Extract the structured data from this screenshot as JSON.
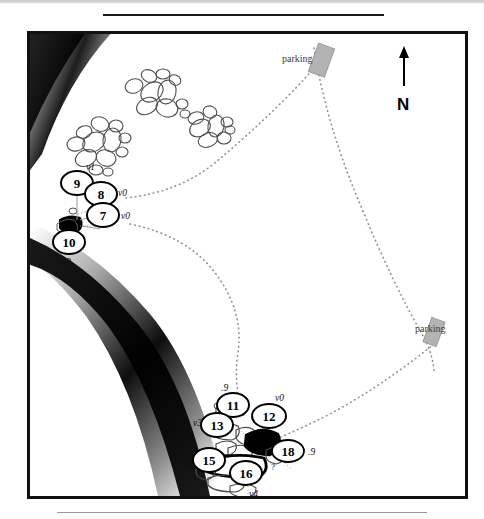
{
  "figure": {
    "type": "map",
    "frame": {
      "x": 27,
      "y": 31,
      "width": 435,
      "height": 462
    }
  },
  "colors": {
    "ink": "#111111",
    "paper": "#ffffff",
    "parking_fill": "#b3b3b3",
    "trail_dot": "#8c8c8c",
    "terrain_dark": "#000000",
    "boulder_outline": "#4a4a4a"
  },
  "compass": {
    "letter": "N",
    "arrow": "north-arrow",
    "x": 400,
    "y": 50
  },
  "parking_areas": [
    {
      "label": "parking",
      "label_x": 279,
      "label_y": 51,
      "rect_x": 310,
      "rect_y": 42,
      "rect_w": 17,
      "rect_h": 30,
      "rotation": 20
    },
    {
      "label": "parking",
      "label_x": 412,
      "label_y": 323,
      "rect_x": 424,
      "rect_y": 316,
      "rect_w": 14,
      "rect_h": 26,
      "rotation": 20
    }
  ],
  "nodes": [
    {
      "id": "9",
      "x": 74,
      "y": 180,
      "rx": 16,
      "ry": 12,
      "tag": "v1",
      "tag_x": 85,
      "tag_y": 162
    },
    {
      "id": "8",
      "x": 98,
      "y": 191,
      "rx": 16,
      "ry": 12,
      "tag": "v0",
      "tag_x": 116,
      "tag_y": 186
    },
    {
      "id": "7",
      "x": 100,
      "y": 212,
      "rx": 16,
      "ry": 12,
      "tag": "v0",
      "tag_x": 119,
      "tag_y": 212
    },
    {
      "id": "10",
      "x": 66,
      "y": 239,
      "rx": 16,
      "ry": 12,
      "tag": "v3",
      "tag_x": 62,
      "tag_y": 258
    },
    {
      "id": "11",
      "x": 230,
      "y": 402,
      "rx": 16,
      "ry": 12,
      "tag": ".9",
      "tag_x": 219,
      "tag_y": 383
    },
    {
      "id": "13",
      "x": 214,
      "y": 422,
      "rx": 16,
      "ry": 12,
      "tag": "v3",
      "tag_x": 194,
      "tag_y": 417
    },
    {
      "id": "12",
      "x": 266,
      "y": 413,
      "rx": 17,
      "ry": 12,
      "tag": "v0",
      "tag_x": 274,
      "tag_y": 395
    },
    {
      "id": "18",
      "x": 285,
      "y": 448,
      "rx": 16,
      "ry": 11,
      "tag": ".9",
      "tag_x": 305,
      "tag_y": 449
    },
    {
      "id": "15",
      "x": 206,
      "y": 457,
      "rx": 16,
      "ry": 12,
      "tag": ".9",
      "tag_x": 186,
      "tag_y": 461
    },
    {
      "id": "16",
      "x": 243,
      "y": 470,
      "rx": 16,
      "ry": 12,
      "tag": "v4",
      "tag_x": 249,
      "tag_y": 490
    }
  ],
  "markers": [
    {
      "name": "question-marker",
      "text": "?",
      "x": 268,
      "y": 466
    }
  ],
  "boulder_clusters": [
    {
      "name": "boulder-cluster-top",
      "cx": 136,
      "cy": 66
    },
    {
      "name": "boulder-cluster-left",
      "cx": 102,
      "cy": 117
    },
    {
      "name": "boulder-cluster-middle",
      "cx": 202,
      "cy": 108
    }
  ],
  "trails": [
    {
      "name": "trail-north-approach"
    },
    {
      "name": "trail-south-approach"
    },
    {
      "name": "trail-parking-connector"
    },
    {
      "name": "trail-east-ridge"
    }
  ],
  "terrain": [
    {
      "name": "terrain-shading-upper-left"
    },
    {
      "name": "terrain-shading-diagonal-band"
    }
  ]
}
